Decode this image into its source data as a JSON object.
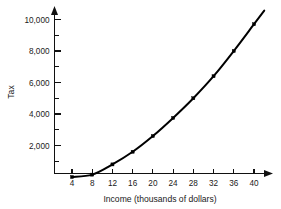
{
  "chart_data": {
    "type": "line",
    "title": "",
    "xlabel": "Income (thousands of dollars)",
    "ylabel": "Tax",
    "x": [
      4,
      8,
      12,
      16,
      20,
      24,
      28,
      32,
      36,
      40
    ],
    "values": [
      0,
      150,
      800,
      1600,
      2600,
      3750,
      5000,
      6400,
      8000,
      9700
    ],
    "series": [
      {
        "name": "Tax",
        "values": [
          0,
          150,
          800,
          1600,
          2600,
          3750,
          5000,
          6400,
          8000,
          9700
        ]
      }
    ],
    "xlim": [
      0,
      42
    ],
    "ylim": [
      0,
      10800
    ],
    "x_tick_labels": [
      "4",
      "8",
      "12",
      "16",
      "20",
      "24",
      "28",
      "32",
      "36",
      "40"
    ],
    "x_tick_values": [
      4,
      8,
      12,
      16,
      20,
      24,
      28,
      32,
      36,
      40
    ],
    "y_tick_labels": [
      "2,000",
      "4,000",
      "6,000",
      "8,000",
      "10,000"
    ],
    "y_tick_values": [
      2000,
      4000,
      6000,
      8000,
      10000
    ],
    "y_minor_tick_values": [
      1000,
      3000,
      5000,
      7000,
      9000
    ],
    "grid": false,
    "legend": "none",
    "marker": "filled-square",
    "line_color": "#000000",
    "marker_color": "#000000",
    "axis_color": "#111111",
    "background_color": "#ffffff",
    "x_axis_arrow": true,
    "y_axis_arrow": true
  },
  "axes": {
    "y_title": "Tax",
    "x_title": "Income (thousands of dollars)"
  }
}
